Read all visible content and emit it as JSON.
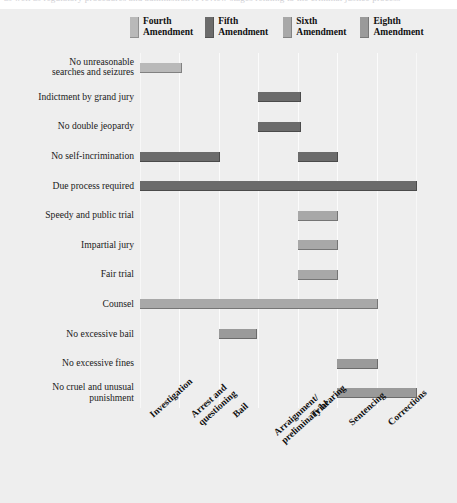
{
  "top_ghost_text": "as well as regulatory procedures and administrative review stages relating to the criminal justice process",
  "legend": {
    "items": [
      {
        "name": "fourth-amendment",
        "line1": "Fourth",
        "line2": "Amendment",
        "color": "#b9b9b9"
      },
      {
        "name": "fifth-amendment",
        "line1": "Fifth",
        "line2": "Amendment",
        "color": "#6b6b6b"
      },
      {
        "name": "sixth-amendment",
        "line1": "Sixth",
        "line2": "Amendment",
        "color": "#a8a8a8"
      },
      {
        "name": "eighth-amendment",
        "line1": "Eighth",
        "line2": "Amendment",
        "color": "#9a9a9a"
      }
    ]
  },
  "chart_data": {
    "type": "bar",
    "orientation": "horizontal-gantt",
    "title": "",
    "xlabel": "",
    "ylabel": "",
    "grid": true,
    "legend_position": "top",
    "stages": [
      "Investigation",
      "Arrest and questioning",
      "Bail",
      "Arraignment/ preliminary hearing",
      "Trial",
      "Sentencing",
      "Corrections"
    ],
    "stage_labels": [
      {
        "line1": "Investigation",
        "line2": ""
      },
      {
        "line1": "Arrest and",
        "line2": "questioning"
      },
      {
        "line1": "Bail",
        "line2": ""
      },
      {
        "line1": "Arraignment/",
        "line2": "preliminary hearing"
      },
      {
        "line1": "Trial",
        "line2": ""
      },
      {
        "line1": "Sentencing",
        "line2": ""
      },
      {
        "line1": "Corrections",
        "line2": ""
      }
    ],
    "categories": [
      "No unreasonable searches and seizures",
      "Indictment by grand jury",
      "No double jeopardy",
      "No self-incrimination",
      "Due process required",
      "Speedy and public trial",
      "Impartial jury",
      "Fair trial",
      "Counsel",
      "No excessive bail",
      "No excessive fines",
      "No cruel and unusual punishment"
    ],
    "rows": [
      {
        "label_line1": "No unreasonable",
        "label_line2": "searches and seizures",
        "amendment": "Fourth",
        "color": "#b9b9b9",
        "segments": [
          {
            "start_stage": "Investigation",
            "end_stage": "Arrest and questioning",
            "start": 0,
            "end": 1.05
          }
        ]
      },
      {
        "label_line1": "Indictment by grand jury",
        "label_line2": "",
        "amendment": "Fifth",
        "color": "#6b6b6b",
        "segments": [
          {
            "start_stage": "Arraignment/ preliminary hearing",
            "end_stage": "Trial",
            "start": 3,
            "end": 4.05
          }
        ]
      },
      {
        "label_line1": "No double jeopardy",
        "label_line2": "",
        "amendment": "Fifth",
        "color": "#6b6b6b",
        "segments": [
          {
            "start_stage": "Arraignment/ preliminary hearing",
            "end_stage": "Trial",
            "start": 3,
            "end": 4.05
          }
        ]
      },
      {
        "label_line1": "No self-incrimination",
        "label_line2": "",
        "amendment": "Fifth",
        "color": "#6b6b6b",
        "segments": [
          {
            "start_stage": "Investigation",
            "end_stage": "Bail",
            "start": 0,
            "end": 2.0
          },
          {
            "start_stage": "Trial",
            "end_stage": "Sentencing",
            "start": 4,
            "end": 5.0
          }
        ]
      },
      {
        "label_line1": "Due process required",
        "label_line2": "",
        "amendment": "Fifth",
        "color": "#6b6b6b",
        "segments": [
          {
            "start_stage": "Investigation",
            "end_stage": "Corrections",
            "start": 0,
            "end": 7.0
          }
        ]
      },
      {
        "label_line1": "Speedy and public trial",
        "label_line2": "",
        "amendment": "Sixth",
        "color": "#a8a8a8",
        "segments": [
          {
            "start_stage": "Trial",
            "end_stage": "Sentencing",
            "start": 4,
            "end": 5.0
          }
        ]
      },
      {
        "label_line1": "Impartial jury",
        "label_line2": "",
        "amendment": "Sixth",
        "color": "#a8a8a8",
        "segments": [
          {
            "start_stage": "Trial",
            "end_stage": "Sentencing",
            "start": 4,
            "end": 5.0
          }
        ]
      },
      {
        "label_line1": "Fair trial",
        "label_line2": "",
        "amendment": "Sixth",
        "color": "#a8a8a8",
        "segments": [
          {
            "start_stage": "Trial",
            "end_stage": "Sentencing",
            "start": 4,
            "end": 5.0
          }
        ]
      },
      {
        "label_line1": "Counsel",
        "label_line2": "",
        "amendment": "Sixth",
        "color": "#a8a8a8",
        "segments": [
          {
            "start_stage": "Investigation",
            "end_stage": "Sentencing",
            "start": 0,
            "end": 6.0
          }
        ]
      },
      {
        "label_line1": "No excessive bail",
        "label_line2": "",
        "amendment": "Eighth",
        "color": "#9a9a9a",
        "segments": [
          {
            "start_stage": "Bail",
            "end_stage": "Arraignment/ preliminary hearing",
            "start": 2,
            "end": 2.95
          }
        ]
      },
      {
        "label_line1": "No excessive fines",
        "label_line2": "",
        "amendment": "Eighth",
        "color": "#9a9a9a",
        "segments": [
          {
            "start_stage": "Sentencing",
            "end_stage": "Corrections",
            "start": 5,
            "end": 6.0
          }
        ]
      },
      {
        "label_line1": "No cruel and unusual",
        "label_line2": "punishment",
        "amendment": "Eighth",
        "color": "#9a9a9a",
        "segments": [
          {
            "start_stage": "Sentencing",
            "end_stage": "Corrections",
            "start": 5,
            "end": 7.0
          }
        ]
      }
    ]
  }
}
